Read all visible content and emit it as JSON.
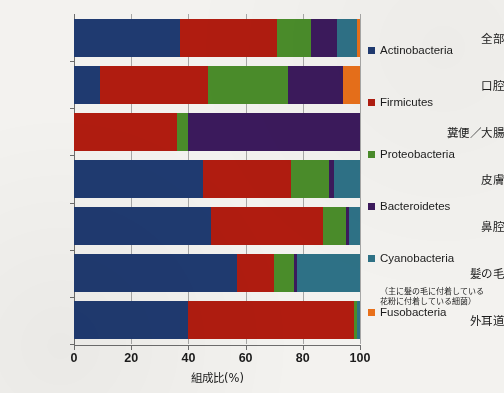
{
  "chart_data": {
    "type": "bar",
    "subtype": "100% stacked horizontal bar",
    "title": "",
    "xlabel": "組成比(%)",
    "ylabel": "",
    "xlim": [
      0,
      100
    ],
    "xticks": [
      0,
      20,
      40,
      60,
      80,
      100
    ],
    "xtick_labels": [
      "0",
      "20",
      "40",
      "60",
      "80",
      "100"
    ],
    "grid": true,
    "legend_position": "right",
    "categories": [
      "全部",
      "口腔",
      "糞便／大腸",
      "皮膚",
      "鼻腔",
      "髪の毛",
      "外耳道"
    ],
    "series": [
      {
        "name": "Actinobacteria",
        "color": "#1f3a70",
        "values": [
          37,
          9,
          0,
          45,
          48,
          57,
          40
        ]
      },
      {
        "name": "Firmicutes",
        "color": "#b01c10",
        "values": [
          34,
          38,
          36,
          31,
          39,
          13,
          58
        ]
      },
      {
        "name": "Proteobacteria",
        "color": "#4a8c2a",
        "values": [
          12,
          28,
          4,
          13,
          8,
          7,
          1
        ]
      },
      {
        "name": "Bacteroidetes",
        "color": "#3b1a5c",
        "values": [
          9,
          19,
          60,
          2,
          1,
          1,
          0
        ]
      },
      {
        "name": "Cyanobacteria",
        "color": "#2e7186",
        "values": [
          7,
          0,
          0,
          9,
          4,
          22,
          1
        ]
      },
      {
        "name": "Fusobacteria",
        "color": "#e8701a",
        "values": [
          1,
          6,
          0,
          0,
          0,
          0,
          0
        ]
      }
    ],
    "legend_note": {
      "attached_to": "Cyanobacteria",
      "line1": "（主に髪の毛に付着している",
      "line2": "花粉に付着している細菌）"
    }
  }
}
